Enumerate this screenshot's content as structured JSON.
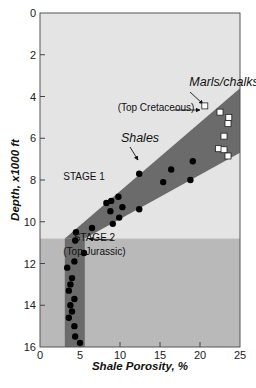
{
  "chart_data": {
    "type": "scatter",
    "title": "",
    "xlabel": "Shale Porosity, %",
    "ylabel": "Depth, x1000 ft",
    "xlim": [
      0,
      25
    ],
    "ylim": [
      0,
      16
    ],
    "y_inverted": true,
    "x_ticks": [
      0,
      5,
      10,
      15,
      20,
      25
    ],
    "y_ticks": [
      0,
      2,
      4,
      6,
      8,
      10,
      12,
      14,
      16
    ],
    "grid": false,
    "colors": {
      "plot_bg_stage1": "#e4e4e4",
      "plot_bg_stage2": "#b9b9b9",
      "band": "#6b6b6b",
      "point_fill": "#000000",
      "square_fill": "#ffffff"
    },
    "stage_boundary_depth": 10.8,
    "band": {
      "stage1_polygon": [
        [
          3.1,
          10.8
        ],
        [
          25,
          3.6
        ],
        [
          25,
          6.7
        ],
        [
          5.6,
          10.8
        ]
      ],
      "stage2_range_x": [
        3.1,
        5.6
      ]
    },
    "series": [
      {
        "name": "Shales",
        "marker": "filled-circle",
        "points": [
          [
            12.4,
            7.7
          ],
          [
            16.4,
            7.5
          ],
          [
            19.1,
            7.1
          ],
          [
            15.4,
            8.1
          ],
          [
            18.8,
            8.0
          ],
          [
            9.8,
            8.8
          ],
          [
            8.9,
            9.0
          ],
          [
            8.3,
            9.1
          ],
          [
            10.3,
            9.3
          ],
          [
            8.8,
            9.5
          ],
          [
            12.4,
            9.4
          ],
          [
            9.9,
            9.8
          ],
          [
            9.1,
            10.1
          ],
          [
            6.5,
            10.3
          ],
          [
            4.5,
            10.5
          ],
          [
            4.4,
            10.9
          ],
          [
            5.5,
            11.5
          ],
          [
            4.3,
            11.9
          ],
          [
            3.4,
            12.2
          ],
          [
            4.0,
            12.7
          ],
          [
            3.8,
            13.0
          ],
          [
            3.6,
            13.3
          ],
          [
            4.3,
            13.7
          ],
          [
            3.8,
            14.0
          ],
          [
            4.0,
            14.3
          ],
          [
            3.6,
            14.6
          ],
          [
            4.3,
            15.0
          ],
          [
            4.4,
            15.5
          ],
          [
            5.0,
            15.8
          ]
        ]
      },
      {
        "name": "Marls/chalks",
        "marker": "open-square",
        "points": [
          [
            20.6,
            4.45
          ],
          [
            22.5,
            4.75
          ],
          [
            23.6,
            5.0
          ],
          [
            23.5,
            5.3
          ],
          [
            23.0,
            5.9
          ],
          [
            22.3,
            6.5
          ],
          [
            23.0,
            6.55
          ],
          [
            23.5,
            6.85
          ]
        ]
      }
    ],
    "annotations": [
      {
        "text": "Marls/chalks",
        "style": "italic",
        "x": 23,
        "y": 3.5
      },
      {
        "text": "(Top Cretaceous)",
        "style": "normal",
        "x": 14.5,
        "y": 4.7
      },
      {
        "text": "Shales",
        "style": "italic",
        "x": 12.5,
        "y": 6.2
      },
      {
        "text": "STAGE 1",
        "style": "normal",
        "x": 5.5,
        "y": 8.0
      },
      {
        "text": "STAGE 2",
        "style": "normal",
        "x": 6.8,
        "y": 10.9
      },
      {
        "text": "(Top Jurassic)",
        "style": "normal",
        "x": 6.8,
        "y": 11.6
      }
    ]
  }
}
